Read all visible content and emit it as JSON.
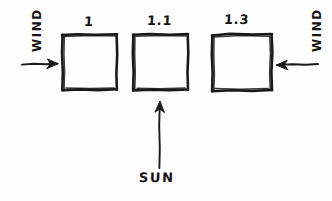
{
  "diagram": {
    "style": "hand-drawn pen sketch",
    "background_color": "#fefefe",
    "ink_color": "#1a1a1a",
    "boxes": [
      {
        "label": "1",
        "name": "box-1",
        "shape": "square",
        "x": 62,
        "y": 34,
        "width": 55,
        "height": 56
      },
      {
        "label": "1.1",
        "name": "box-2",
        "shape": "square",
        "x": 133,
        "y": 34,
        "width": 55,
        "height": 56
      },
      {
        "label": "1.3",
        "name": "box-3",
        "shape": "rectangle",
        "x": 212,
        "y": 34,
        "width": 60,
        "height": 56
      }
    ],
    "arrows": [
      {
        "name": "wind-arrow-left",
        "label": "WIND",
        "direction": "right",
        "points_to": "box-1"
      },
      {
        "name": "wind-arrow-right",
        "label": "WIND",
        "direction": "left",
        "points_to": "box-3"
      },
      {
        "name": "sun-arrow",
        "label": "SUN",
        "direction": "up",
        "points_to": "box-2"
      }
    ],
    "labels": {
      "wind_left": "WIND",
      "wind_right": "WIND",
      "sun": "SUN"
    }
  }
}
